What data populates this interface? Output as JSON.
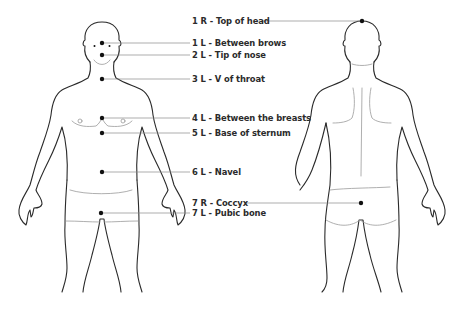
{
  "diagram": {
    "type": "body-points-front-back",
    "figures": [
      {
        "name": "front-view",
        "side": "L"
      },
      {
        "name": "back-view",
        "side": "R"
      }
    ],
    "colors": {
      "outline": "#2a2a2a",
      "detail": "#9a9a9a",
      "dot": "#111111",
      "leader": "#8a8a8a",
      "label": "#2b2b2b"
    },
    "points": [
      {
        "id": "p1r",
        "label": "1 R - Top of head",
        "number": "1",
        "side": "R",
        "location": "Top of head",
        "figure": "back",
        "dot": [
          362,
          21
        ],
        "label_pos": [
          192,
          17
        ]
      },
      {
        "id": "p1l",
        "label": "1 L - Between brows",
        "number": "1",
        "side": "L",
        "location": "Between brows",
        "figure": "front",
        "dot": [
          102,
          43
        ],
        "label_pos": [
          192,
          38
        ]
      },
      {
        "id": "p2l",
        "label": "2 L - Tip of nose",
        "number": "2",
        "side": "L",
        "location": "Tip of nose",
        "figure": "front",
        "dot": [
          102,
          55
        ],
        "label_pos": [
          192,
          50
        ]
      },
      {
        "id": "p3l",
        "label": "3 L - V of throat",
        "number": "3",
        "side": "L",
        "location": "V of throat",
        "figure": "front",
        "dot": [
          102,
          79
        ],
        "label_pos": [
          192,
          74
        ]
      },
      {
        "id": "p4l",
        "label": "4 L - Between the breasts",
        "number": "4",
        "side": "L",
        "location": "Between the breasts",
        "figure": "front",
        "dot": [
          102,
          118
        ],
        "label_pos": [
          192,
          113
        ]
      },
      {
        "id": "p5l",
        "label": "5 L - Base of sternum",
        "number": "5",
        "side": "L",
        "location": "Base of sternum",
        "figure": "front",
        "dot": [
          102,
          133
        ],
        "label_pos": [
          192,
          128
        ]
      },
      {
        "id": "p6l",
        "label": "6 L - Navel",
        "number": "6",
        "side": "L",
        "location": "Navel",
        "figure": "front",
        "dot": [
          102,
          172
        ],
        "label_pos": [
          192,
          167
        ]
      },
      {
        "id": "p7r",
        "label": "7 R - Coccyx",
        "number": "7",
        "side": "R",
        "location": "Coccyx",
        "figure": "back",
        "dot": [
          361,
          203
        ],
        "label_pos": [
          192,
          198
        ]
      },
      {
        "id": "p7l",
        "label": "7 L - Pubic bone",
        "number": "7",
        "side": "L",
        "location": "Pubic bone",
        "figure": "front",
        "dot": [
          101,
          213
        ],
        "label_pos": [
          192,
          208
        ]
      }
    ]
  }
}
